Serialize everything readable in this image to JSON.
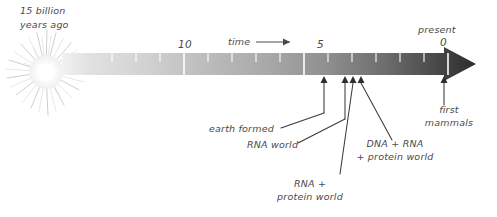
{
  "figure": {
    "start_label_line1": "15 billion",
    "start_label_line2": "years ago",
    "axis_label": "time",
    "present_line1": "present",
    "present_line2": "0",
    "tick_label_10": "10",
    "tick_label_5": "5",
    "axis": {
      "units": "billions of years ago",
      "start_value": 15,
      "end_value": 0,
      "major_ticks": [
        10,
        5,
        0
      ],
      "minor_tick_interval": 1
    },
    "colors": {
      "bar_start": "#e9e9e9",
      "bar_end": "#2e2e2e",
      "text": "#4a4a4a",
      "leader_line": "#3a3a3a",
      "tick": "#ffffff",
      "starburst": "#c9c9c9"
    },
    "annotations": [
      {
        "id": "earth-formed",
        "label": "earth formed",
        "label_line1": "earth formed",
        "label_line2": "",
        "marker_x_value": 4.6
      },
      {
        "id": "rna-world",
        "label": "RNA world",
        "label_line1": "RNA world",
        "label_line2": "",
        "marker_x_value": 3.8
      },
      {
        "id": "rna-protein-world",
        "label": "RNA + protein world",
        "label_line1": "RNA +",
        "label_line2": "protein world",
        "marker_x_value": 3.5
      },
      {
        "id": "dna-rna-protein-world",
        "label": "DNA + RNA + protein world",
        "label_line1": "DNA + RNA",
        "label_line2": "+ protein world",
        "marker_x_value": 3.2
      },
      {
        "id": "first-mammals",
        "label": "first mammals",
        "label_line1": "first",
        "label_line2": "mammals",
        "marker_x_value": 0.2
      }
    ]
  }
}
